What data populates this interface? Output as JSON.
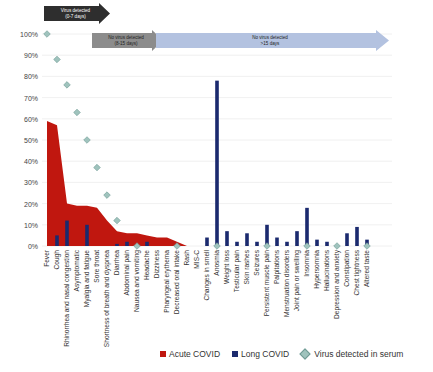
{
  "chart_data": {
    "type": "bar",
    "title": "",
    "xlabel": "",
    "ylabel": "",
    "ylim": [
      0,
      100
    ],
    "y_ticks": [
      "0%",
      "10%",
      "20%",
      "30%",
      "40%",
      "50%",
      "60%",
      "70%",
      "80%",
      "90%",
      "100%"
    ],
    "grid": true,
    "legend_position": "bottom",
    "categories": [
      "Fever",
      "Cough",
      "Rhinorrhea and nasal congestion",
      "Asymptomatic",
      "Myalgia and fatigue",
      "Sore throat",
      "Shortness of breath and dyspnea",
      "Diarrhea",
      "Abdominal pain",
      "Nausea and vomiting",
      "Headache",
      "Dizziness",
      "Pharyngeal erythema",
      "Decreased oral intake",
      "Rash",
      "MIS-C",
      "Changes in smell",
      "Anosmia",
      "Weight loss",
      "Testicular pain",
      "Skin rashes",
      "Seizures",
      "Persistent muscle pain",
      "Palpitations",
      "Menstruation disorders",
      "Joint pain or swelling",
      "Insomnia",
      "Hypersomnia",
      "Hallucinations",
      "Depression and anxiety",
      "Constipation",
      "Chest tightness",
      "Altered taste"
    ],
    "series": [
      {
        "name": "Acute COVID",
        "type": "area",
        "color": "#c0170f",
        "values": [
          59,
          57,
          20,
          19,
          19,
          18,
          12,
          7,
          6,
          6,
          5,
          4,
          4,
          2,
          0,
          0,
          0,
          0,
          0,
          0,
          0,
          0,
          0,
          0,
          0,
          0,
          0,
          0,
          0,
          0,
          0,
          0,
          0
        ]
      },
      {
        "name": "Long COVID",
        "type": "bar",
        "color": "#1b2a6e",
        "values": [
          0,
          5,
          12,
          0,
          10,
          0,
          0,
          1,
          2,
          0,
          2,
          0,
          0,
          0,
          0,
          0,
          4,
          78,
          7,
          2,
          6,
          2,
          10,
          4,
          2,
          7,
          18,
          3,
          2,
          0,
          6,
          9,
          3
        ]
      },
      {
        "name": "Virus detected in serum",
        "type": "scatter",
        "color": "#9fc3bd",
        "values": [
          100,
          88,
          76,
          63,
          50,
          37,
          24,
          12,
          null,
          0,
          null,
          null,
          null,
          0,
          null,
          null,
          null,
          0,
          null,
          null,
          null,
          null,
          0,
          null,
          null,
          null,
          0,
          null,
          null,
          0,
          null,
          null,
          0
        ]
      }
    ]
  },
  "phases": [
    {
      "label_line1": "Virus detected",
      "label_line2": "(0-7 days)",
      "color": "#2e2e2e",
      "text_color": "#ffffff"
    },
    {
      "label_line1": "No virus detected",
      "label_line2": "(8-15 days)",
      "color": "#8c8c8c",
      "text_color": "#222222"
    },
    {
      "label_line1": "No virus detected",
      "label_line2": ">15 days",
      "color": "#b3c2e0",
      "text_color": "#222222"
    }
  ],
  "legend": {
    "acute": "Acute COVID",
    "long": "Long COVID",
    "virus": "Virus detected in serum"
  }
}
